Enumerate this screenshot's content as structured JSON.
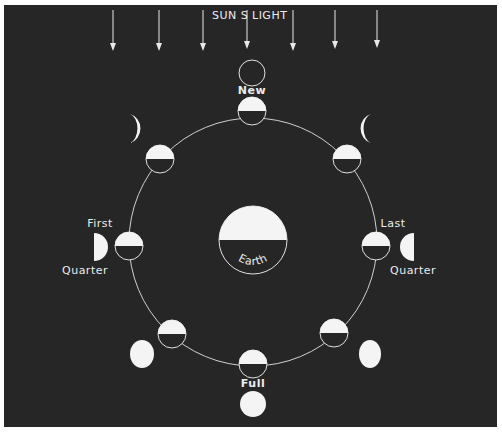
{
  "diagram": {
    "title_left": "SUN S",
    "title_right": "LIGHT",
    "center_body": {
      "label": "Earth"
    },
    "phase_labels": {
      "new": "New",
      "first": "First",
      "first_quarter": "Quarter",
      "last": "Last",
      "last_quarter": "Quarter",
      "full": "Full"
    },
    "colors": {
      "background": "#262626",
      "lit": "#f4f4f4",
      "line": "#d8d8d8"
    },
    "sunlight_arrows_count": 7,
    "moon_positions": [
      "new",
      "waxing-crescent",
      "first-quarter",
      "waxing-gibbous",
      "full",
      "waning-gibbous",
      "last-quarter",
      "waning-crescent"
    ]
  }
}
